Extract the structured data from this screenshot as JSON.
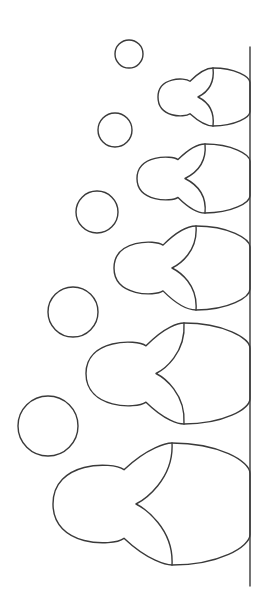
{
  "colors": {
    "background": "#ffffff",
    "line": "#3a3a3a"
  },
  "figures": [
    {
      "name": "doll-1",
      "size_rank": 1
    },
    {
      "name": "doll-2",
      "size_rank": 2
    },
    {
      "name": "doll-3",
      "size_rank": 3
    },
    {
      "name": "doll-4",
      "size_rank": 4
    },
    {
      "name": "doll-5",
      "size_rank": 5
    }
  ],
  "circle_count": 5
}
